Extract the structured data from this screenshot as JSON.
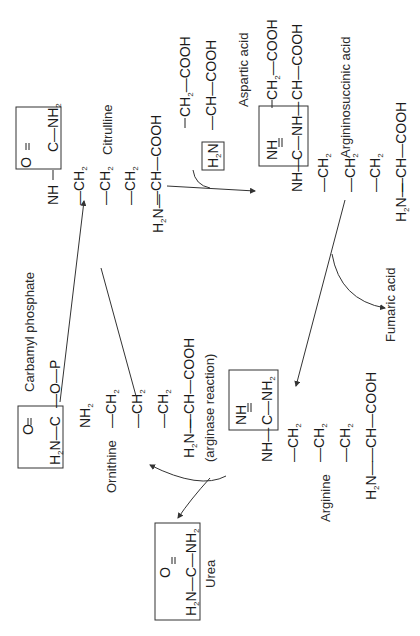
{
  "diagram": {
    "orientation": "rotated -90deg",
    "compounds": {
      "citrulline": {
        "label": "Citrulline",
        "box": "O═C—NH₂",
        "box_top": "O",
        "box_mid": "C—NH",
        "chain": "NH—CH₂—CH₂—CH₂—CH—COOH",
        "amine": "H₂N"
      },
      "aspartic_acid": {
        "label": "Aspartic acid",
        "top": "CH₂—COOH",
        "bottom": "CH—COOH",
        "box": "H₂N"
      },
      "argininosuccinic_acid": {
        "label": "Argininosuccinic acid",
        "top": "CH₂—COOH",
        "box_nh": "NH",
        "box_mid": "C—NH",
        "side": "CH—COOH",
        "chain": "NH—CH₂—CH₂—CH₂—CH—COOH",
        "amine": "H₂N"
      },
      "carbamyl_phosphate": {
        "label": "Carbamyl phosphate",
        "box_top": "O",
        "box_mid": "H₂N—C",
        "tail": "—O—P"
      },
      "ornithine": {
        "label": "Ornithine",
        "chain": "NH₂—CH₂—CH₂—CH₂—CH—COOH",
        "amine": "H₂N"
      },
      "arginine": {
        "label": "Arginine",
        "box_nh": "NH",
        "box_mid": "C—NH₂",
        "chain": "NH—CH₂—CH₂—CH₂—CH—COOH",
        "amine": "H₂N"
      },
      "urea": {
        "label": "Urea",
        "top": "O",
        "formula": "H₂N—C—NH₂"
      },
      "fumaric_acid": {
        "label": "Fumaric acid"
      }
    },
    "annotations": {
      "arginase": "(arginase reaction)"
    },
    "atoms": {
      "NH": "NH",
      "NH2": "NH",
      "CH2": "CH",
      "CH": "CH",
      "COOH": "COOH",
      "H2N": "H",
      "N": "N",
      "C": "C",
      "O": "O",
      "P": "P",
      "sub2": "2",
      "dash": "—",
      "dbl": "═"
    }
  }
}
